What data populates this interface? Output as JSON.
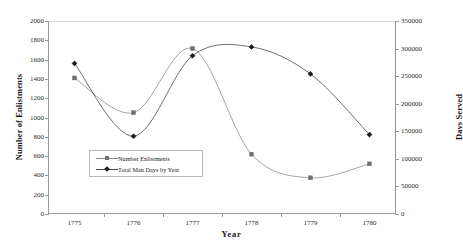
{
  "chart_data": {
    "type": "line",
    "title": "",
    "xlabel": "Year",
    "ylabel": "Number of Enlistments",
    "y2label": "Days Served",
    "categories": [
      "1775",
      "1776",
      "1777",
      "1778",
      "1779",
      "1780"
    ],
    "x": [
      1775,
      1776,
      1777,
      1778,
      1779,
      1780
    ],
    "xlim": [
      1774.55,
      1780.45
    ],
    "ylim": [
      0,
      2000
    ],
    "y2lim": [
      0,
      350000
    ],
    "grid": false,
    "legend_position": "inside-lower-left",
    "yticks": [
      0,
      200,
      400,
      600,
      800,
      1000,
      1200,
      1400,
      1600,
      1800,
      2000
    ],
    "ytick_labels": [
      "0",
      "200",
      "400",
      "600",
      "800",
      "1000",
      "1200",
      "1400",
      "1600",
      "1800",
      "2000"
    ],
    "y2ticks": [
      0,
      50000,
      100000,
      150000,
      200000,
      250000,
      300000,
      350000
    ],
    "y2tick_labels": [
      "0",
      "50000",
      "100000",
      "150000",
      "200000",
      "250000",
      "300000",
      "350000"
    ],
    "series": [
      {
        "name": "Number Enlistments",
        "axis": "left",
        "marker": "square",
        "color": "#8c8c8c",
        "marker_color": "#6f6f6f",
        "values": [
          1410,
          1050,
          1715,
          620,
          375,
          520
        ]
      },
      {
        "name": "Total Man Days by Year",
        "axis": "right",
        "marker": "diamond",
        "color": "#4a4a4a",
        "marker_color": "#1a1a1a",
        "values": [
          273000,
          141000,
          287000,
          303000,
          254000,
          144000
        ],
        "values_left_scale": [
          1560,
          805,
          1640,
          1730,
          1450,
          825
        ]
      }
    ]
  },
  "legend": {
    "items": [
      {
        "label": "Number Enlistments",
        "marker": "square-marker"
      },
      {
        "label": "Total Man Days by Year",
        "marker": "diamond-marker"
      }
    ]
  },
  "colors": {
    "enlistments_line": "#8c8c8c",
    "mandays_line": "#4a4a4a",
    "axis": "#9a9a9a",
    "text": "#1a1a1a",
    "background": "#ffffff"
  }
}
